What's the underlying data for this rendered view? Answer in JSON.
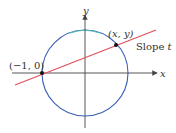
{
  "diagram": {
    "type": "unit-circle-rational-parametrization",
    "axes": {
      "x_label": "x",
      "y_label": "y",
      "color": "#444444"
    },
    "circle": {
      "center_px": [
        85,
        73
      ],
      "radius_px": 43,
      "color": "#3a5fb8",
      "top_tint": "#4fc1b0"
    },
    "line": {
      "color": "#e0505a",
      "from_px": [
        15,
        85
      ],
      "to_px": [
        156,
        30
      ]
    },
    "points": [
      {
        "label": "(−1, 0)",
        "px": [
          42,
          73
        ]
      },
      {
        "label": "(x, y)",
        "px": [
          116,
          45
        ]
      }
    ],
    "annotations": {
      "slope_label": "Slope ",
      "slope_var": "t"
    }
  }
}
